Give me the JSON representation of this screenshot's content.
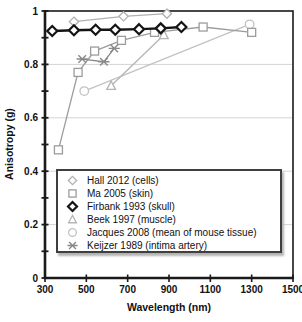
{
  "chart_data": {
    "type": "line",
    "title": "",
    "xlabel": "Wavelength (nm)",
    "ylabel": "Anisotropy (g)",
    "xlim": [
      300,
      1500
    ],
    "ylim": [
      0,
      1
    ],
    "x_ticks": [
      300,
      500,
      700,
      900,
      1100,
      1300,
      1500
    ],
    "y_ticks": [
      0,
      0.2,
      0.4,
      0.6,
      0.8,
      1
    ],
    "y_tick_labels": [
      "0",
      "0.2",
      "0.4",
      "0.6",
      "0.8",
      "1"
    ],
    "y_minor_tick_step": 0.1,
    "grid": "horizontal",
    "legend_position": "inside bottom",
    "axis_color": "#1a1a1a",
    "grid_color": "#d4d4d4",
    "series": [
      {
        "name": "Hall 2012 (cells)",
        "marker": "diamond",
        "color": "#b0b0b0",
        "points": [
          [
            440,
            0.96
          ],
          [
            680,
            0.98
          ],
          [
            890,
            0.99
          ]
        ]
      },
      {
        "name": "Ma 2005 (skin)",
        "marker": "square",
        "color": "#9c9c9c",
        "points": [
          [
            365,
            0.48
          ],
          [
            460,
            0.77
          ],
          [
            540,
            0.85
          ],
          [
            670,
            0.89
          ],
          [
            830,
            0.92
          ],
          [
            1065,
            0.94
          ],
          [
            1300,
            0.92
          ]
        ]
      },
      {
        "name": "Firbank 1993 (skull)",
        "marker": "diamond-bold",
        "color": "#141414",
        "points": [
          [
            335,
            0.925
          ],
          [
            440,
            0.928
          ],
          [
            545,
            0.93
          ],
          [
            640,
            0.93
          ],
          [
            755,
            0.932
          ],
          [
            860,
            0.935
          ],
          [
            960,
            0.94
          ]
        ]
      },
      {
        "name": "Beek 1997 (muscle)",
        "marker": "triangle",
        "color": "#b5b5b5",
        "points": [
          [
            620,
            0.72
          ],
          [
            875,
            0.91
          ]
        ]
      },
      {
        "name": "Jacques 2008 (mean of mouse tissue)",
        "marker": "circle",
        "color": "#c2c2c2",
        "points": [
          [
            490,
            0.7
          ],
          [
            1290,
            0.95
          ]
        ]
      },
      {
        "name": "Keijzer 1989 (intima artery)",
        "marker": "x-dash",
        "color": "#8a8a8a",
        "points": [
          [
            480,
            0.82
          ],
          [
            585,
            0.81
          ],
          [
            635,
            0.86
          ]
        ]
      }
    ]
  }
}
